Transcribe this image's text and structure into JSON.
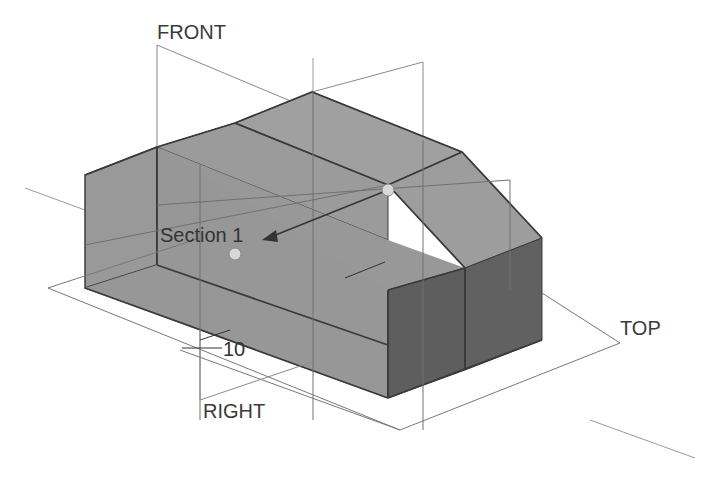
{
  "diagram": {
    "type": "cad-3d-model-view",
    "planes": {
      "front": "FRONT",
      "top": "TOP",
      "right": "RIGHT"
    },
    "section_label": "Section 1",
    "dimension_value": "10",
    "colors": {
      "background": "#ffffff",
      "face_light": "#9a9a9a",
      "face_mid": "#8c8c8c",
      "face_dark": "#5a5a5a",
      "edge": "#3c3c3c",
      "plane_line": "#8a8a8a",
      "handle": "#d8d8d8"
    }
  }
}
